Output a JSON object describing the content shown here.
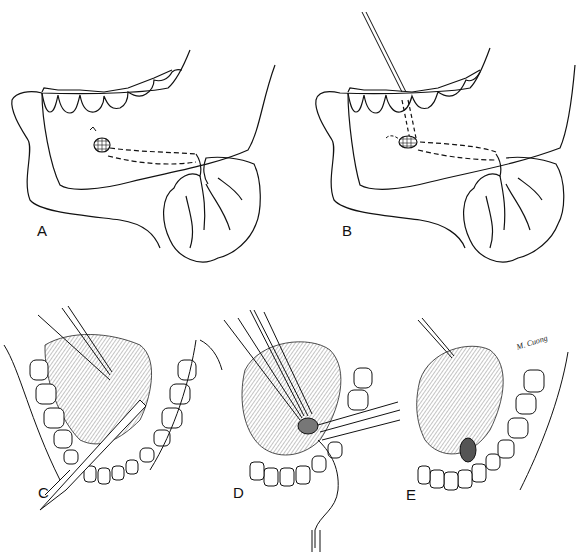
{
  "figure": {
    "panels": [
      {
        "id": "A",
        "label": "A",
        "view": "lateral mandible with submandibular gland, duct and calculus"
      },
      {
        "id": "B",
        "label": "B",
        "view": "lateral mandible with probe inserted through duct toward calculus"
      },
      {
        "id": "C",
        "label": "C",
        "view": "intraoral floor of mouth, traction suture and incision with scalpel"
      },
      {
        "id": "D",
        "label": "D",
        "view": "intraoral, calculus exposed and grasped with forceps, probe in duct"
      },
      {
        "id": "E",
        "label": "E",
        "view": "intraoral, duct opened after stone removal"
      }
    ],
    "signature": "M. Cuong"
  },
  "colors": {
    "ink": "#111111",
    "shade": "#8a8a8a",
    "background": "#ffffff"
  }
}
